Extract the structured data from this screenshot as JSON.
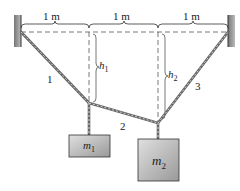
{
  "diagram": {
    "spans": [
      "1 m",
      "1 m",
      "1 m"
    ],
    "heights": [
      {
        "var": "h",
        "sub": "1"
      },
      {
        "var": "h",
        "sub": "2"
      }
    ],
    "ropes": [
      "1",
      "2",
      "3"
    ],
    "masses": [
      {
        "var": "m",
        "sub": "1"
      },
      {
        "var": "m",
        "sub": "2"
      }
    ]
  }
}
